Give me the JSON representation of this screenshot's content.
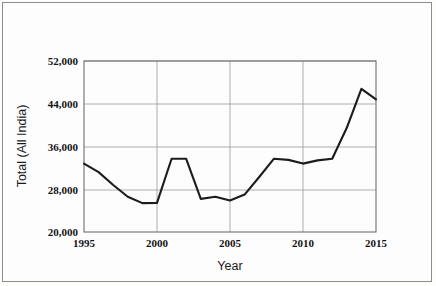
{
  "chart_data": {
    "type": "line",
    "title": "",
    "xlabel": "Year",
    "ylabel": "Total (All India)",
    "xlim": [
      1995,
      2015
    ],
    "ylim": [
      20000,
      52000
    ],
    "grid": true,
    "legend": "none",
    "x_ticks": [
      "1995",
      "2000",
      "2005",
      "2010",
      "2015"
    ],
    "y_ticks": [
      "20,000",
      "28,000",
      "36,000",
      "44,000",
      "52,000"
    ],
    "x_tick_values": [
      1995,
      2000,
      2005,
      2010,
      2015
    ],
    "y_tick_values": [
      20000,
      28000,
      36000,
      44000,
      52000
    ],
    "x": [
      1995,
      1996,
      1997,
      1998,
      1999,
      2000,
      2001,
      2002,
      2003,
      2004,
      2005,
      2006,
      2007,
      2008,
      2009,
      2010,
      2011,
      2012,
      2013,
      2014,
      2015
    ],
    "values": [
      32800,
      31200,
      28800,
      26600,
      25400,
      25450,
      33700,
      33700,
      26200,
      26600,
      25900,
      27000,
      30300,
      33700,
      33500,
      32800,
      33400,
      33700,
      39500,
      46800,
      44800
    ],
    "series": [
      {
        "name": "Total (All India)",
        "color": "#1c1c1c",
        "values": [
          32800,
          31200,
          28800,
          26600,
          25400,
          25450,
          33700,
          33700,
          26200,
          26600,
          25900,
          27000,
          30300,
          33700,
          33500,
          32800,
          33400,
          33700,
          39500,
          46800,
          44800
        ]
      }
    ]
  },
  "axes": {
    "y_title": "Total (All India)",
    "x_title": "Year"
  }
}
